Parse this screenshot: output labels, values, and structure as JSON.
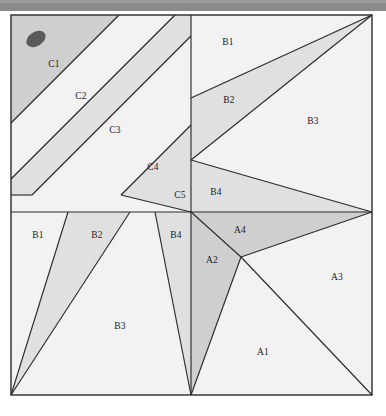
{
  "figure": {
    "title": "",
    "frame": {
      "x": 11,
      "y": 15,
      "width": 361,
      "height": 380,
      "border_color": "#2b2b2b"
    },
    "palette": {
      "background": "#ffffff",
      "top_band": "#8a8a8a",
      "fill_light": "#f2f2f2",
      "fill_medium": "#e0e0e0",
      "fill_dark": "#cfcfcf",
      "stroke": "#2b2b2b",
      "marker": "#5a5a5a"
    },
    "marker": {
      "name": "dark-ellipse-marker",
      "cx": 36,
      "cy": 39,
      "rx": 10,
      "ry": 7,
      "rotation": -32,
      "color": "#5a5a5a"
    },
    "axes": {
      "vertical_x": 191,
      "horizontal_y": 212
    },
    "regions": [
      {
        "id": "C1",
        "label": "C1",
        "lx": 54,
        "ly": 65,
        "shade": "dark"
      },
      {
        "id": "C2",
        "label": "C2",
        "lx": 81,
        "ly": 97,
        "shade": "light"
      },
      {
        "id": "C3",
        "label": "C3",
        "lx": 115,
        "ly": 131,
        "shade": "medium"
      },
      {
        "id": "C4",
        "label": "C4",
        "lx": 153,
        "ly": 168,
        "shade": "light"
      },
      {
        "id": "C5",
        "label": "C5",
        "lx": 180,
        "ly": 196,
        "shade": "medium"
      },
      {
        "id": "B1t",
        "label": "B1",
        "lx": 228,
        "ly": 43,
        "shade": "light"
      },
      {
        "id": "B2t",
        "label": "B2",
        "lx": 229,
        "ly": 101,
        "shade": "medium"
      },
      {
        "id": "B3t",
        "label": "B3",
        "lx": 313,
        "ly": 122,
        "shade": "light"
      },
      {
        "id": "B4t",
        "label": "B4",
        "lx": 216,
        "ly": 193,
        "shade": "medium"
      },
      {
        "id": "B1b",
        "label": "B1",
        "lx": 38,
        "ly": 236,
        "shade": "light"
      },
      {
        "id": "B2b",
        "label": "B2",
        "lx": 97,
        "ly": 236,
        "shade": "medium"
      },
      {
        "id": "B4b",
        "label": "B4",
        "lx": 176,
        "ly": 236,
        "shade": "medium"
      },
      {
        "id": "B3b",
        "label": "B3",
        "lx": 120,
        "ly": 327,
        "shade": "light"
      },
      {
        "id": "A4",
        "label": "A4",
        "lx": 240,
        "ly": 231,
        "shade": "medium"
      },
      {
        "id": "A2",
        "label": "A2",
        "lx": 212,
        "ly": 261,
        "shade": "medium"
      },
      {
        "id": "A3",
        "label": "A3",
        "lx": 337,
        "ly": 278,
        "shade": "light"
      },
      {
        "id": "A1",
        "label": "A1",
        "lx": 263,
        "ly": 353,
        "shade": "light"
      }
    ],
    "vertices": {
      "center": {
        "x": 191,
        "y": 212
      },
      "upper_mid_node": {
        "x": 191,
        "y": 160
      },
      "right_mid_node": {
        "x": 372,
        "y": 212
      },
      "a_node": {
        "x": 241,
        "y": 257
      },
      "top_right": {
        "x": 372,
        "y": 15
      },
      "bottom_left": {
        "x": 11,
        "y": 395
      },
      "bottom_right": {
        "x": 372,
        "y": 395
      },
      "top_left": {
        "x": 11,
        "y": 15
      }
    }
  }
}
